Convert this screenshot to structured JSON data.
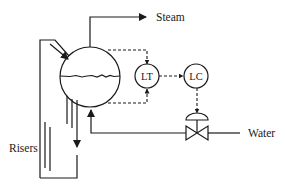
{
  "diagram": {
    "type": "process-control-schematic",
    "title": "",
    "colors": {
      "line": "#1a1a1a",
      "background": "#ffffff"
    },
    "labels": {
      "steam": "Steam",
      "water": "Water",
      "risers": "Risers"
    },
    "instruments": [
      {
        "id": "LT",
        "label": "LT",
        "description": "level transmitter"
      },
      {
        "id": "LC",
        "label": "LC",
        "description": "level controller"
      }
    ],
    "equipment": [
      {
        "id": "drum",
        "label": "",
        "shape": "circle",
        "description": "steam drum with water level line"
      },
      {
        "id": "control-valve",
        "label": "",
        "shape": "valve with diaphragm actuator"
      }
    ],
    "connections": [
      {
        "from": "drum",
        "to": "Steam",
        "style": "solid",
        "arrow": "end"
      },
      {
        "from": "drum-top",
        "to": "LT",
        "style": "dashed",
        "arrow": "end"
      },
      {
        "from": "drum-bottom",
        "to": "LT",
        "style": "dashed",
        "arrow": "end"
      },
      {
        "from": "LT",
        "to": "LC",
        "style": "dashed",
        "arrow": "end"
      },
      {
        "from": "LC",
        "to": "control-valve",
        "style": "dashed",
        "arrow": "end"
      },
      {
        "from": "Water",
        "to": "drum",
        "style": "solid",
        "via": "control-valve",
        "arrow": "end"
      },
      {
        "from": "risers",
        "to": "drum",
        "style": "solid",
        "arrow": "end"
      },
      {
        "from": "drum",
        "to": "downcomer",
        "style": "solid",
        "arrow": "end"
      }
    ]
  }
}
